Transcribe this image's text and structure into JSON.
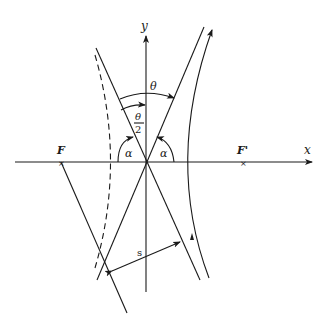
{
  "diagram": {
    "axes": {
      "x_label": "x",
      "y_label": "y"
    },
    "foci": {
      "left": "F",
      "right": "F'"
    },
    "angles": {
      "theta": "θ",
      "half_theta_num": "θ",
      "half_theta_den": "2",
      "alpha_left": "α",
      "alpha_right": "α"
    },
    "distance_label": "s",
    "colors": {
      "ink": "#1a1a1a",
      "background": "#ffffff"
    }
  }
}
